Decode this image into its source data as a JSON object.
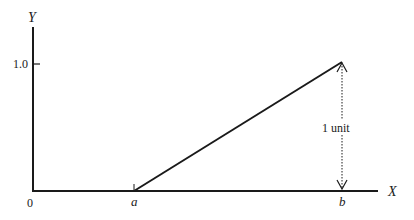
{
  "diagram": {
    "axes": {
      "y_label": "Y",
      "x_label": "X",
      "origin_label": "0",
      "y_tick_label": "1.0"
    },
    "points": {
      "a_label": "a",
      "b_label": "b"
    },
    "annotation": {
      "height_label": "1 unit"
    },
    "colors": {
      "line": "#1a1a1a",
      "background": "#ffffff"
    }
  }
}
